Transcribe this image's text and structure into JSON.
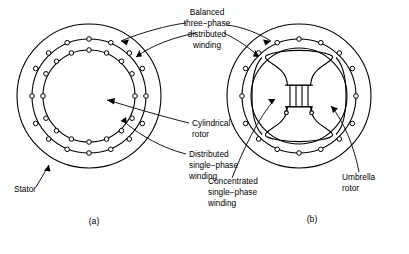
{
  "figure": {
    "type": "technical-diagram",
    "background_color": "#ffffff",
    "line_color": "#000000"
  },
  "labels": {
    "balanced_winding": {
      "line1": "Balanced",
      "line2": "three−phase",
      "line3": "distributed",
      "line4": "winding"
    },
    "cylindrical_rotor": {
      "line1": "Cylindrical",
      "line2": "rotor"
    },
    "distributed_winding": {
      "line1": "Distributed",
      "line2": "single−phase",
      "line3": "winding"
    },
    "stator": {
      "line1": "Stator"
    },
    "concentrated_winding": {
      "line1": "Concentrated",
      "line2": "single−phase",
      "line3": "winding"
    },
    "umbrella_rotor": {
      "line1": "Umbrella",
      "line2": "rotor"
    }
  },
  "captions": {
    "left": "(a)",
    "right": "(b)"
  },
  "machine_a": {
    "name": "cylindrical-rotor-machine",
    "center_x": 89,
    "center_y": 96,
    "stator_outer_radius": 72,
    "stator_bore_radius": 57,
    "rotor_radius": 46,
    "stator_slot_count": 16,
    "rotor_slot_count": 16,
    "slot_radius": 2.3
  },
  "machine_b": {
    "name": "umbrella-rotor-machine",
    "center_x": 299,
    "center_y": 96,
    "stator_outer_radius": 72,
    "stator_bore_radius": 57,
    "rotor_radius": 48,
    "stator_slot_count": 16,
    "slot_radius": 2.3,
    "field_coil_turns": 4,
    "terminal_count": 2
  }
}
